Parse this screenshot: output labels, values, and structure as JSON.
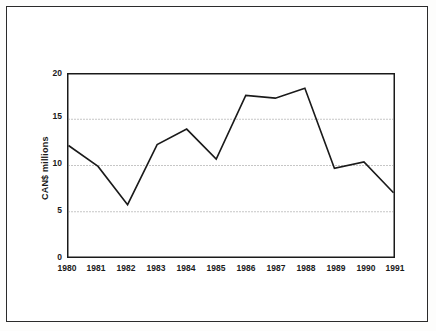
{
  "chart_data": {
    "type": "line",
    "title": "",
    "subtitle": "",
    "xlabel": "",
    "ylabel": "CAN$ millions",
    "categories": [
      "1980",
      "1981",
      "1982",
      "1983",
      "1984",
      "1985",
      "1986",
      "1987",
      "1988",
      "1989",
      "1990",
      "1991"
    ],
    "x": [
      1980,
      1981,
      1982,
      1983,
      1984,
      1985,
      1986,
      1987,
      1988,
      1989,
      1990,
      1991
    ],
    "values": [
      12.2,
      9.9,
      5.7,
      12.3,
      14.0,
      10.7,
      17.7,
      17.4,
      18.5,
      9.7,
      10.4,
      7.0
    ],
    "series": [
      {
        "name": "CAN$ millions",
        "values": [
          12.2,
          9.9,
          5.7,
          12.3,
          14.0,
          10.7,
          17.7,
          17.4,
          18.5,
          9.7,
          10.4,
          7.0
        ]
      }
    ],
    "ylim": [
      0,
      20
    ],
    "yticks": [
      0,
      5,
      10,
      15,
      20
    ],
    "ytick_labels": [
      "0",
      "5",
      "10",
      "15",
      "20"
    ],
    "xtick_labels": [
      "1980",
      "1981",
      "1982",
      "1983",
      "1984",
      "1985",
      "1986",
      "1987",
      "1988",
      "1989",
      "1990",
      "1991"
    ],
    "grid": "horizontal-dotted",
    "gridlines_at": [
      5,
      10,
      15
    ],
    "legend": "none",
    "line_color": "#1a1a1a",
    "grid_color": "#9a9a9a",
    "axis_color": "#1a1a1a",
    "background_color": "#ffffff"
  }
}
